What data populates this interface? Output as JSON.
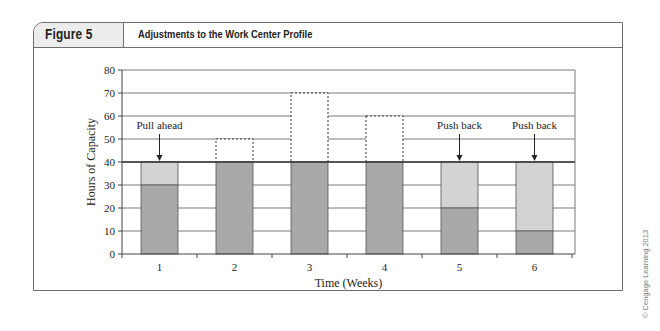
{
  "figure": {
    "label": "Figure 5",
    "title": "Adjustments to the Work Center Profile",
    "credit": "© Cengage Learning 2013"
  },
  "colors": {
    "dark_bar": "#a9a9a9",
    "light_bar": "#d3d3d3",
    "grid": "#7a7a7a",
    "capacity_line": "#333333",
    "frame": "#6e6e6e"
  },
  "chart_data": {
    "type": "bar",
    "title": "Adjustments to the Work Center Profile",
    "xlabel": "Time (Weeks)",
    "ylabel": "Hours of Capacity",
    "categories": [
      "1",
      "2",
      "3",
      "4",
      "5",
      "6"
    ],
    "ylim": [
      0,
      80
    ],
    "yticks": [
      0,
      10,
      20,
      30,
      40,
      50,
      60,
      70,
      80
    ],
    "grid": true,
    "capacity_line": 40,
    "series": [
      {
        "name": "Load (dark)",
        "values": [
          30,
          40,
          40,
          40,
          20,
          10
        ]
      },
      {
        "name": "Adjusted load (light)",
        "values": [
          10,
          0,
          0,
          0,
          20,
          30
        ]
      },
      {
        "name": "Original overload (dashed)",
        "values": [
          0,
          10,
          30,
          20,
          0,
          0
        ]
      }
    ],
    "annotations": [
      {
        "text": "Pull ahead",
        "week": "1",
        "arrow_to": 40
      },
      {
        "text": "Push back",
        "week": "5",
        "arrow_to": 40
      },
      {
        "text": "Push back",
        "week": "6",
        "arrow_to": 40
      }
    ]
  }
}
